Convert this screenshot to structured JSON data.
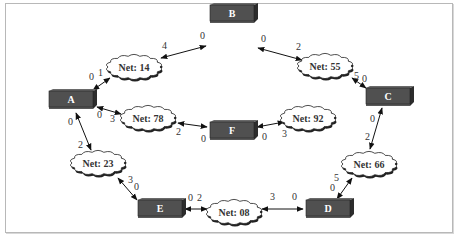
{
  "colors": {
    "node_front": "#505050",
    "node_top": "#6a6a6a",
    "node_side": "#2c2c2c",
    "node_text": "#ffffff",
    "cloud_fill": "#ffffff",
    "cloud_stroke": "#222222",
    "edge": "#111111",
    "frame": "#b8b8b8"
  },
  "nodes": [
    {
      "id": "A",
      "label": "A",
      "x": 49,
      "y": 91
    },
    {
      "id": "B",
      "label": "B",
      "x": 210,
      "y": 5
    },
    {
      "id": "C",
      "label": "C",
      "x": 366,
      "y": 88
    },
    {
      "id": "D",
      "label": "D",
      "x": 306,
      "y": 200
    },
    {
      "id": "E",
      "label": "E",
      "x": 138,
      "y": 200
    },
    {
      "id": "F",
      "label": "F",
      "x": 210,
      "y": 122
    }
  ],
  "nets": [
    {
      "id": "net14",
      "label": "Net: 14",
      "cx": 134,
      "cy": 67
    },
    {
      "id": "net55",
      "label": "Net: 55",
      "cx": 325,
      "cy": 66
    },
    {
      "id": "net78",
      "label": "Net: 78",
      "cx": 148,
      "cy": 118
    },
    {
      "id": "net92",
      "label": "Net: 92",
      "cx": 308,
      "cy": 118
    },
    {
      "id": "net23",
      "label": "Net: 23",
      "cx": 98,
      "cy": 163
    },
    {
      "id": "net66",
      "label": "Net: 66",
      "cx": 369,
      "cy": 164
    },
    {
      "id": "net08",
      "label": "Net: 08",
      "cx": 234,
      "cy": 212
    }
  ],
  "edges": [
    {
      "x1": 161,
      "y1": 58,
      "x2": 206,
      "y2": 46,
      "labels": [
        {
          "t": "4",
          "x": 162,
          "y": 49
        },
        {
          "t": "0",
          "x": 200,
          "y": 39
        }
      ]
    },
    {
      "x1": 93,
      "y1": 90,
      "x2": 110,
      "y2": 78,
      "labels": [
        {
          "t": "0",
          "x": 89,
          "y": 80
        },
        {
          "t": "1",
          "x": 98,
          "y": 76
        }
      ]
    },
    {
      "x1": 258,
      "y1": 48,
      "x2": 302,
      "y2": 60,
      "labels": [
        {
          "t": "0",
          "x": 261,
          "y": 42
        },
        {
          "t": "2",
          "x": 296,
          "y": 50
        }
      ]
    },
    {
      "x1": 352,
      "y1": 78,
      "x2": 366,
      "y2": 88,
      "labels": [
        {
          "t": "5",
          "x": 354,
          "y": 79
        },
        {
          "t": "0",
          "x": 362,
          "y": 82
        }
      ]
    },
    {
      "x1": 97,
      "y1": 107,
      "x2": 121,
      "y2": 114,
      "labels": [
        {
          "t": "0",
          "x": 97,
          "y": 118
        },
        {
          "t": "3",
          "x": 110,
          "y": 122
        }
      ]
    },
    {
      "x1": 178,
      "y1": 123,
      "x2": 207,
      "y2": 127,
      "labels": [
        {
          "t": "2",
          "x": 176,
          "y": 135
        },
        {
          "t": "0",
          "x": 201,
          "y": 142
        }
      ]
    },
    {
      "x1": 257,
      "y1": 127,
      "x2": 284,
      "y2": 122,
      "labels": [
        {
          "t": "0",
          "x": 262,
          "y": 140
        },
        {
          "t": "3",
          "x": 282,
          "y": 137
        }
      ]
    },
    {
      "x1": 76,
      "y1": 113,
      "x2": 91,
      "y2": 150,
      "labels": [
        {
          "t": "0",
          "x": 68,
          "y": 125
        },
        {
          "t": "2",
          "x": 78,
          "y": 148
        }
      ]
    },
    {
      "x1": 118,
      "y1": 178,
      "x2": 137,
      "y2": 200,
      "labels": [
        {
          "t": "3",
          "x": 128,
          "y": 183
        },
        {
          "t": "0",
          "x": 134,
          "y": 190
        }
      ]
    },
    {
      "x1": 382,
      "y1": 108,
      "x2": 370,
      "y2": 149,
      "labels": [
        {
          "t": "0",
          "x": 370,
          "y": 122
        },
        {
          "t": "2",
          "x": 365,
          "y": 140
        }
      ]
    },
    {
      "x1": 352,
      "y1": 178,
      "x2": 337,
      "y2": 199,
      "labels": [
        {
          "t": "5",
          "x": 334,
          "y": 181
        },
        {
          "t": "0",
          "x": 330,
          "y": 191
        }
      ]
    },
    {
      "x1": 185,
      "y1": 209,
      "x2": 207,
      "y2": 209,
      "labels": [
        {
          "t": "0",
          "x": 188,
          "y": 201
        },
        {
          "t": "2",
          "x": 197,
          "y": 201
        }
      ]
    },
    {
      "x1": 262,
      "y1": 209,
      "x2": 303,
      "y2": 209,
      "labels": [
        {
          "t": "3",
          "x": 270,
          "y": 200
        },
        {
          "t": "0",
          "x": 292,
          "y": 200
        }
      ]
    }
  ]
}
